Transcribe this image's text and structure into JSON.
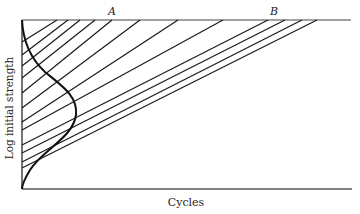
{
  "diagram": {
    "labels": {
      "point_a": "A",
      "point_b": "B",
      "x_axis": "Cycles",
      "y_axis": "Log initial strength"
    },
    "colors": {
      "stroke": "#1a1a1a",
      "background": "#ffffff"
    },
    "axes": {
      "origin": [
        22,
        189
      ],
      "top_left": [
        22,
        20
      ],
      "top_right": [
        351,
        20
      ],
      "bottom_right": [
        352,
        189
      ]
    },
    "lines": [
      {
        "start": [
          22,
          42
        ],
        "end": [
          57,
          20
        ]
      },
      {
        "start": [
          22,
          55
        ],
        "end": [
          68,
          20
        ]
      },
      {
        "start": [
          22,
          66
        ],
        "end": [
          80,
          20
        ]
      },
      {
        "start": [
          22,
          78
        ],
        "end": [
          95,
          20
        ]
      },
      {
        "start": [
          22,
          93
        ],
        "end": [
          112,
          20
        ]
      },
      {
        "start": [
          22,
          108
        ],
        "end": [
          140,
          20
        ]
      },
      {
        "start": [
          22,
          122
        ],
        "end": [
          178,
          20
        ]
      },
      {
        "start": [
          22,
          130
        ],
        "end": [
          223,
          20
        ]
      },
      {
        "start": [
          22,
          145
        ],
        "end": [
          268,
          20
        ]
      },
      {
        "start": [
          22,
          153
        ],
        "end": [
          285,
          20
        ]
      },
      {
        "start": [
          22,
          162
        ],
        "end": [
          302,
          20
        ]
      },
      {
        "start": [
          22,
          168
        ],
        "end": [
          317,
          20
        ]
      }
    ],
    "distribution_curve": "M22,20 C23,40 30,58 45,72 C62,86 78,96 76,115 C73,138 42,150 30,170 C24,180 22,186 22,189"
  }
}
